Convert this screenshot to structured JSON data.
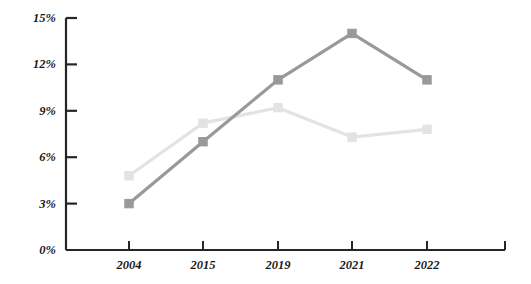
{
  "chart_data": {
    "type": "line",
    "title": "",
    "subtitle": "",
    "xlabel": "",
    "ylabel": "",
    "categories": [
      "2004",
      "2015",
      "2019",
      "2021",
      "2022"
    ],
    "series": [
      {
        "name": "series-dark",
        "color": "#999999",
        "marker": "square",
        "values": [
          3.0,
          7.0,
          11.0,
          14.0,
          11.0
        ]
      },
      {
        "name": "series-light",
        "color": "#e3e3e3",
        "marker": "square",
        "values": [
          4.8,
          8.2,
          9.2,
          7.3,
          7.8
        ]
      }
    ],
    "ylim": [
      0,
      15
    ],
    "ytick_values": [
      0,
      3,
      6,
      9,
      12,
      15
    ],
    "ytick_labels": [
      "0%",
      "3%",
      "6%",
      "9%",
      "12%",
      "15%"
    ],
    "grid": false,
    "legend": "none",
    "axis_color": "#262626",
    "label_color": "#1a1a1a"
  },
  "axes": {
    "y_labels": [
      "15%",
      "12%",
      "9%",
      "6%",
      "3%",
      "0%"
    ],
    "x_labels": [
      "2004",
      "2015",
      "2019",
      "2021",
      "2022"
    ]
  }
}
